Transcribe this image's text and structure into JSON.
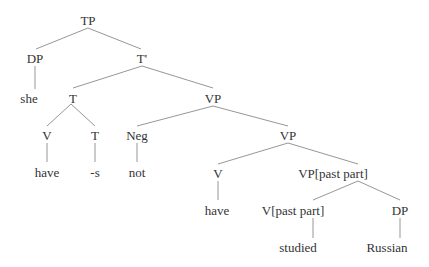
{
  "diagram": {
    "type": "syntax-tree",
    "colors": {
      "text": "#333333",
      "edge": "#8a8a8a",
      "background": "#ffffff"
    },
    "nodes": [
      {
        "id": "tp",
        "label": "TP",
        "x": 88,
        "y": 20
      },
      {
        "id": "dp1",
        "label": "DP",
        "x": 35,
        "y": 58
      },
      {
        "id": "tbar",
        "label": "T'",
        "x": 142,
        "y": 58
      },
      {
        "id": "she",
        "label": "she",
        "x": 29,
        "y": 98
      },
      {
        "id": "t1",
        "label": "T",
        "x": 73,
        "y": 98
      },
      {
        "id": "vp1",
        "label": "VP",
        "x": 213,
        "y": 98
      },
      {
        "id": "v1",
        "label": "V",
        "x": 47,
        "y": 135
      },
      {
        "id": "t2",
        "label": "T",
        "x": 95,
        "y": 135
      },
      {
        "id": "neg",
        "label": "Neg",
        "x": 137,
        "y": 135
      },
      {
        "id": "vp2",
        "label": "VP",
        "x": 288,
        "y": 135
      },
      {
        "id": "have1",
        "label": "have",
        "x": 47,
        "y": 172
      },
      {
        "id": "s",
        "label": "-s",
        "x": 95,
        "y": 172
      },
      {
        "id": "not",
        "label": "not",
        "x": 137,
        "y": 172
      },
      {
        "id": "v2",
        "label": "V",
        "x": 218,
        "y": 173
      },
      {
        "id": "vppp",
        "label": "VP[past part]",
        "x": 333,
        "y": 173
      },
      {
        "id": "have2",
        "label": "have",
        "x": 217,
        "y": 210
      },
      {
        "id": "vpart",
        "label": "V[past part]",
        "x": 293,
        "y": 210
      },
      {
        "id": "dp2",
        "label": "DP",
        "x": 400,
        "y": 210
      },
      {
        "id": "studied",
        "label": "studied",
        "x": 298,
        "y": 247
      },
      {
        "id": "russian",
        "label": "Russian",
        "x": 387,
        "y": 247
      }
    ],
    "edges": [
      {
        "from": "tp",
        "to": "dp1",
        "x1": 88,
        "y1": 28,
        "x2": 36,
        "y2": 49
      },
      {
        "from": "tp",
        "to": "tbar",
        "x1": 88,
        "y1": 28,
        "x2": 141,
        "y2": 49
      },
      {
        "from": "dp1",
        "to": "she",
        "x1": 35,
        "y1": 66,
        "x2": 35,
        "y2": 89
      },
      {
        "from": "tbar",
        "to": "t1",
        "x1": 142,
        "y1": 66,
        "x2": 73,
        "y2": 88
      },
      {
        "from": "tbar",
        "to": "vp1",
        "x1": 142,
        "y1": 66,
        "x2": 213,
        "y2": 88
      },
      {
        "from": "t1",
        "to": "v1",
        "x1": 71,
        "y1": 104,
        "x2": 47,
        "y2": 126
      },
      {
        "from": "t1",
        "to": "t2",
        "x1": 71,
        "y1": 104,
        "x2": 95,
        "y2": 126
      },
      {
        "from": "vp1",
        "to": "neg",
        "x1": 213,
        "y1": 106,
        "x2": 137,
        "y2": 126
      },
      {
        "from": "vp1",
        "to": "vp2",
        "x1": 213,
        "y1": 106,
        "x2": 288,
        "y2": 126
      },
      {
        "from": "v1",
        "to": "have1",
        "x1": 47,
        "y1": 143,
        "x2": 47,
        "y2": 162
      },
      {
        "from": "t2",
        "to": "s",
        "x1": 95,
        "y1": 143,
        "x2": 95,
        "y2": 162
      },
      {
        "from": "neg",
        "to": "not",
        "x1": 137,
        "y1": 143,
        "x2": 137,
        "y2": 162
      },
      {
        "from": "vp2",
        "to": "v2",
        "x1": 288,
        "y1": 143,
        "x2": 218,
        "y2": 164
      },
      {
        "from": "vp2",
        "to": "vppp",
        "x1": 288,
        "y1": 143,
        "x2": 358,
        "y2": 164
      },
      {
        "from": "v2",
        "to": "have2",
        "x1": 218,
        "y1": 181,
        "x2": 218,
        "y2": 200
      },
      {
        "from": "vppp",
        "to": "vpart",
        "x1": 358,
        "y1": 181,
        "x2": 313,
        "y2": 200
      },
      {
        "from": "vppp",
        "to": "dp2",
        "x1": 358,
        "y1": 181,
        "x2": 400,
        "y2": 200
      },
      {
        "from": "vpart",
        "to": "studied",
        "x1": 313,
        "y1": 218,
        "x2": 313,
        "y2": 238
      },
      {
        "from": "dp2",
        "to": "russian",
        "x1": 400,
        "y1": 218,
        "x2": 400,
        "y2": 238
      }
    ]
  }
}
